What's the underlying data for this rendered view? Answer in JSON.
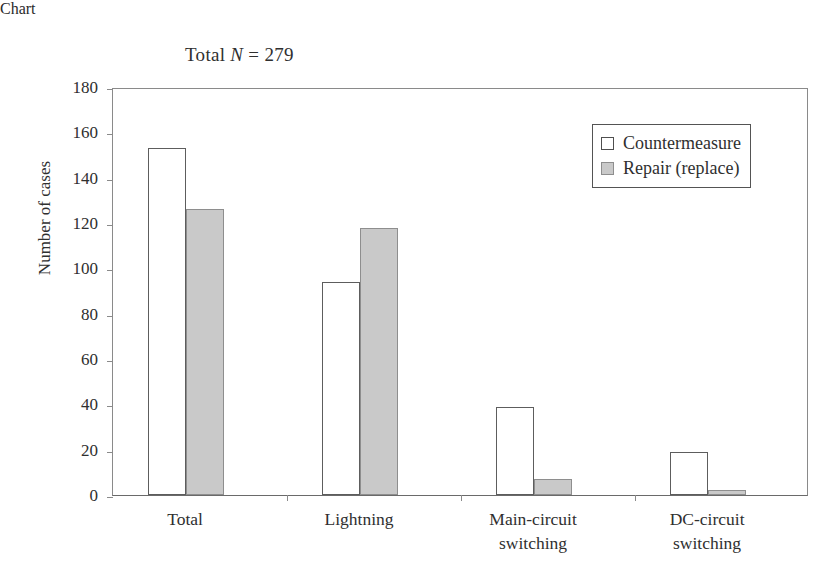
{
  "chart_data": {
    "type": "bar",
    "title": "Total N = 279",
    "title_prefix": "Total ",
    "title_variable": "N",
    "title_suffix": " = 279",
    "xlabel": "",
    "ylabel": "Number of cases",
    "ylim": [
      0,
      180
    ],
    "ytick_step": 20,
    "yticks": [
      0,
      20,
      40,
      60,
      80,
      100,
      120,
      140,
      160,
      180
    ],
    "ytick_labels": [
      "0",
      "20",
      "40",
      "60",
      "80",
      "100",
      "120",
      "140",
      "160",
      "180"
    ],
    "grid": false,
    "legend_position": "upper right",
    "categories": [
      "Total",
      "Lightning",
      "Main-circuit switching",
      "DC-circuit switching"
    ],
    "category_lines": [
      [
        "Total"
      ],
      [
        "Lightning"
      ],
      [
        "Main-circuit",
        "switching"
      ],
      [
        "DC-circuit",
        "switching"
      ]
    ],
    "series": [
      {
        "name": "Countermeasure",
        "fill": "#ffffff",
        "edge": "#5d5d5d",
        "values": [
          153,
          94,
          39,
          19
        ]
      },
      {
        "name": "Repair (replace)",
        "fill": "#c9c9c9",
        "edge": "#8e8e8e",
        "values": [
          126,
          118,
          7,
          2
        ]
      }
    ]
  },
  "legend": {
    "items": [
      {
        "label": "Countermeasure",
        "style": "open"
      },
      {
        "label": "Repair (replace)",
        "style": "filled"
      }
    ]
  }
}
